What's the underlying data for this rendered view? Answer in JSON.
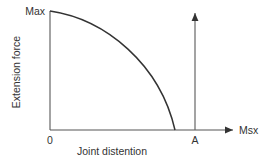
{
  "chart_data": {
    "type": "line",
    "title": "",
    "xlabel": "Joint distention",
    "ylabel": "Extension force",
    "y_tick_labels": {
      "top": "Max",
      "origin": "0"
    },
    "x_marker_label": "A",
    "x_axis_end_label": "Msx",
    "curve": {
      "description": "Force decreases from Max at zero distention to zero before point A (concave-down decay)",
      "points": [
        [
          0,
          1.0
        ],
        [
          0.2,
          0.96
        ],
        [
          0.4,
          0.86
        ],
        [
          0.6,
          0.69
        ],
        [
          0.8,
          0.43
        ],
        [
          0.92,
          0.2
        ],
        [
          1.0,
          0.0
        ]
      ]
    },
    "marker_A_x_fraction": 1.16,
    "colors": {
      "axis": "#555555",
      "curve": "#333333",
      "text": "#333333"
    }
  }
}
